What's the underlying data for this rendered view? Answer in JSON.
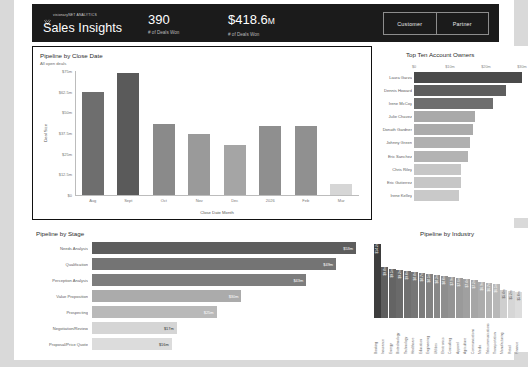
{
  "header": {
    "logo_text": "visionaryNET\nANALYTICS",
    "app_title": "Sales Insights",
    "kpis": [
      {
        "value": "390",
        "suffix": "",
        "label": "# of Deals Won"
      },
      {
        "value": "$418.6",
        "suffix": "M",
        "label": "# of Deals Won"
      }
    ],
    "segments": [
      {
        "label": "Customer"
      },
      {
        "label": "Partner"
      }
    ],
    "bg_color": "#1b1b1b"
  },
  "panels": {
    "close_date": {
      "title": "Pipeline by Close Date",
      "subtitle": "All open deals"
    },
    "owners": {
      "title": "Top Ten Account Owners"
    },
    "stage": {
      "title": "Pipeline by Stage"
    },
    "industry": {
      "title": "Pipeline by Industry"
    }
  },
  "chart_data": [
    {
      "id": "pipeline-by-close-date",
      "type": "bar",
      "title": "Pipeline by Close Date",
      "subtitle": "All open deals",
      "xlabel": "Close Date Month",
      "ylabel": "Deal Size",
      "categories": [
        "Aug",
        "Sept",
        "Oct",
        "Nov",
        "Dec",
        "2026",
        "Feb",
        "Mar"
      ],
      "values": [
        62.5,
        74.0,
        43.0,
        37.0,
        30.5,
        42.0,
        41.5,
        6.5
      ],
      "ylim": [
        0,
        75
      ],
      "yticks": [
        0,
        12.5,
        25,
        37.5,
        50,
        62.5,
        75
      ],
      "ytick_labels": [
        "$0",
        "$12.5m",
        "$25m",
        "$37.5m",
        "$50m",
        "$62.5m",
        "$75m"
      ],
      "grid": false,
      "bar_colors": [
        "#6e6e6e",
        "#5a5a5a",
        "#8a8a8a",
        "#9a9a9a",
        "#a5a5a5",
        "#8f8f8f",
        "#909090",
        "#d6d6d6"
      ]
    },
    {
      "id": "top-ten-account-owners",
      "type": "bar",
      "orientation": "horizontal",
      "title": "Top Ten Account Owners",
      "categories": [
        "Laura Garza",
        "Dennis Howard",
        "Irene McCoy",
        "Julie Chavez",
        "Donath Gardner",
        "Johnny Green",
        "Eric Sanchez",
        "Chris Riley",
        "Eric Gutierrez",
        "Irene Kelley"
      ],
      "values": [
        30.0,
        25.5,
        22.0,
        17.0,
        16.5,
        15.5,
        15.0,
        13.0,
        13.0,
        12.5
      ],
      "xticks": [
        0,
        10,
        20,
        30
      ],
      "xtick_labels": [
        "$0",
        "$10m",
        "$20m",
        "$30m"
      ],
      "xlim": [
        0,
        30
      ],
      "bar_colors": [
        "#4a4a4a",
        "#5e5e5e",
        "#6e6e6e",
        "#a9a9a9",
        "#ababab",
        "#b0b0b0",
        "#b3b3b3",
        "#c6c6c6",
        "#c6c6c6",
        "#c9c9c9"
      ]
    },
    {
      "id": "pipeline-by-stage",
      "type": "bar",
      "orientation": "horizontal",
      "title": "Pipeline by Stage",
      "categories": [
        "Needs Analysis",
        "Qualification",
        "Perception Analysis",
        "Value Proposition",
        "Prospecting",
        "Negotiation/Review",
        "Proposal/Price Quote"
      ],
      "values": [
        53,
        49,
        43,
        30,
        25,
        17,
        16
      ],
      "value_labels": [
        "$53m",
        "$49m",
        "$43m",
        "$30m",
        "$25m",
        "$17m",
        "$16m"
      ],
      "xlim": [
        0,
        53
      ],
      "bar_colors": [
        "#5d5d5d",
        "#747474",
        "#7d7d7d",
        "#ababab",
        "#b9b9b9",
        "#d5d5d5",
        "#dcdcdc"
      ],
      "label_is_dark": [
        false,
        false,
        false,
        false,
        false,
        true,
        true
      ]
    },
    {
      "id": "pipeline-by-industry",
      "type": "bar",
      "title": "Pipeline by Industry",
      "categories": [
        "Banking",
        "Insurance",
        "Energy",
        "Biotechnology",
        "Technology",
        "Healthcare",
        "Education",
        "Engineering",
        "Utilities",
        "Electronics",
        "Consulting",
        "Apparel",
        "Agriculture",
        "Communications",
        "Media",
        "Telecommunications",
        "Transportation",
        "Manufacturing",
        "Retail",
        "Finance"
      ],
      "values": [
        14.2,
        9.8,
        9.5,
        9.2,
        9.0,
        8.8,
        8.7,
        8.5,
        8.3,
        8.0,
        7.9,
        7.6,
        7.4,
        7.2,
        6.9,
        6.7,
        6.5,
        5.4,
        5.2,
        5.0
      ],
      "value_labels": [
        "$14.2m",
        "$9.8m",
        "$9.5m",
        "$9.2m",
        "$9.0m",
        "$8.8m",
        "$8.7m",
        "$8.5m",
        "$8.3m",
        "$8.0m",
        "$7.9m",
        "$7.6m",
        "$7.4m",
        "$7.2m",
        "$6.9m",
        "$6.7m",
        "$6.5m",
        "$5.4m",
        "$5.2m",
        "$5.0m"
      ],
      "ylim": [
        0,
        14.2
      ],
      "bar_colors": [
        "#3d3d3d",
        "#5e5e5e",
        "#646464",
        "#6a6a6a",
        "#707070",
        "#767676",
        "#7c7c7c",
        "#828282",
        "#888888",
        "#8e8e8e",
        "#949494",
        "#9a9a9a",
        "#a0a0a0",
        "#a6a6a6",
        "#acacac",
        "#b2b2b2",
        "#b8b8b8",
        "#cfcfcf",
        "#d6d6d6",
        "#dddddd"
      ],
      "label_is_dark": [
        false,
        false,
        false,
        false,
        false,
        false,
        false,
        false,
        false,
        false,
        false,
        false,
        false,
        false,
        false,
        false,
        false,
        true,
        true,
        true
      ]
    }
  ]
}
